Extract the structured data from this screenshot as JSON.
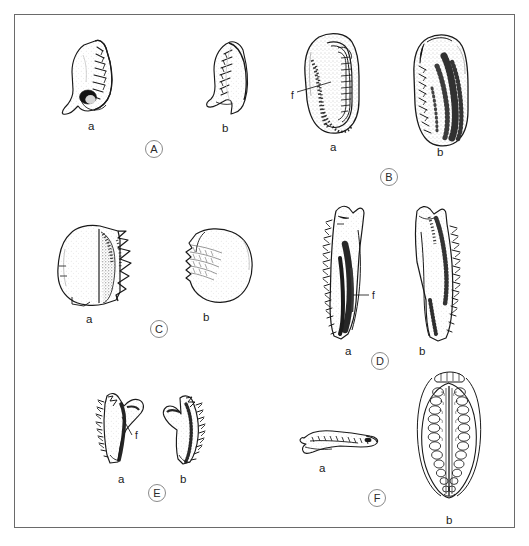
{
  "plate": {
    "title": "Comparative plate of serrated dental and skeletal elements",
    "border_color": "#6a6a6a",
    "background_color": "#ffffff",
    "ink_color": "#1a1a1a",
    "panel_count": 6,
    "specimens_per_panel": 2
  },
  "panels": [
    {
      "id": "A",
      "letter": "A",
      "letter_x": 145,
      "letter_y": 140,
      "specimens": [
        {
          "tag": "a",
          "label": "a",
          "label_x": 88,
          "label_y": 120,
          "shape": "curved-serrated-tooth-left",
          "has_feature_mark": false,
          "description": "hooked tooth, serrated posterior edge, dark basal pit"
        },
        {
          "tag": "b",
          "label": "b",
          "label_x": 222,
          "label_y": 122,
          "shape": "curved-serrated-tooth-right",
          "has_feature_mark": false,
          "description": "hooked tooth, serrated anterior edge, flared base"
        }
      ]
    },
    {
      "id": "B",
      "letter": "B",
      "letter_x": 380,
      "letter_y": 168,
      "feature_label": "f",
      "specimens": [
        {
          "tag": "a",
          "label": "a",
          "label_x": 330,
          "label_y": 141,
          "shape": "elongate-oval-grooved",
          "has_feature_mark": true,
          "feature_label": "f",
          "feature_label_x": 291,
          "feature_label_y": 96,
          "description": "elongate oval element with longitudinal groove and stippled shading"
        },
        {
          "tag": "b",
          "label": "b",
          "label_x": 437,
          "label_y": 146,
          "shape": "elongate-oval-serrate-edge",
          "has_feature_mark": false,
          "description": "elongate oval element, serrate left margin, dense stippling"
        }
      ]
    },
    {
      "id": "C",
      "letter": "C",
      "letter_x": 150,
      "letter_y": 320,
      "specimens": [
        {
          "tag": "a",
          "label": "a",
          "label_x": 86,
          "label_y": 313,
          "shape": "blocky-zigzag-crest",
          "has_feature_mark": false,
          "description": "blocky element with zigzag serrate crest and dark shading"
        },
        {
          "tag": "b",
          "label": "b",
          "label_x": 203,
          "label_y": 311,
          "shape": "rounded-ridged-disc",
          "has_feature_mark": false,
          "description": "rounded stippled disc with ridged anterior margin"
        }
      ]
    },
    {
      "id": "D",
      "letter": "D",
      "letter_x": 371,
      "letter_y": 352,
      "feature_label": "f",
      "specimens": [
        {
          "tag": "a",
          "label": "a",
          "label_x": 345,
          "label_y": 345,
          "shape": "elongate-blade-serrate-left",
          "has_feature_mark": true,
          "feature_label": "f",
          "feature_label_x": 372,
          "feature_label_y": 298,
          "description": "elongate blade, serrate left margin, dark longitudinal band"
        },
        {
          "tag": "b",
          "label": "b",
          "label_x": 419,
          "label_y": 345,
          "shape": "elongate-blade-serrate-right",
          "has_feature_mark": false,
          "description": "elongate blade, serrate right margin, mottled shading"
        }
      ]
    },
    {
      "id": "E",
      "letter": "E",
      "letter_x": 148,
      "letter_y": 484,
      "feature_label": "f",
      "specimens": [
        {
          "tag": "a",
          "label": "a",
          "label_x": 118,
          "label_y": 473,
          "shape": "hook-serrate-left",
          "has_feature_mark": true,
          "feature_label": "f",
          "feature_label_x": 135,
          "feature_label_y": 433,
          "description": "hooked element, serrate outer margin, recurved tip"
        },
        {
          "tag": "b",
          "label": "b",
          "label_x": 180,
          "label_y": 473,
          "shape": "hook-serrate-right",
          "has_feature_mark": false,
          "description": "hooked element, serrate inner margin, recurved tip"
        }
      ]
    },
    {
      "id": "F",
      "letter": "F",
      "letter_x": 368,
      "letter_y": 489,
      "specimens": [
        {
          "tag": "a",
          "label": "a",
          "label_x": 319,
          "label_y": 462,
          "shape": "small-curved-denticulate",
          "has_feature_mark": false,
          "description": "small recurved denticulate element in lateral view"
        },
        {
          "tag": "b",
          "label": "b",
          "label_x": 446,
          "label_y": 514,
          "shape": "leaf-coiled-array",
          "has_feature_mark": false,
          "description": "leaf-shaped element with central axis and paired coiled denticle rows"
        }
      ]
    }
  ]
}
